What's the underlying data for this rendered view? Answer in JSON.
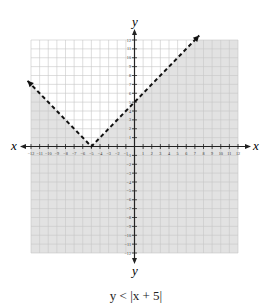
{
  "chart_data": {
    "type": "line",
    "title": "y < |x + 5|",
    "xlabel": "x",
    "ylabel": "y",
    "xlim": [
      -12,
      12
    ],
    "ylim": [
      -12,
      12
    ],
    "grid": true,
    "x_ticks": [
      -12,
      -11,
      -10,
      -9,
      -8,
      -7,
      -6,
      -5,
      -4,
      -3,
      -2,
      -1,
      1,
      2,
      3,
      4,
      5,
      6,
      7,
      8,
      9,
      10,
      11,
      12
    ],
    "y_ticks": [
      -12,
      -11,
      -10,
      -9,
      -8,
      -7,
      -6,
      -5,
      -4,
      -3,
      -2,
      -1,
      1,
      2,
      3,
      4,
      5,
      6,
      7,
      8,
      9,
      10,
      11,
      12
    ],
    "boundary": {
      "equation": "y = |x + 5|",
      "style": "dashed",
      "vertex": [
        -5,
        0
      ],
      "points": [
        [
          -12.4,
          7.4
        ],
        [
          -5,
          0
        ],
        [
          7.5,
          12.5
        ]
      ]
    },
    "shaded_region": "below boundary (y < |x + 5|)",
    "shade_color": "#e2e2e2"
  },
  "labels": {
    "x_axis": "x",
    "y_axis": "y",
    "caption": "y < |x + 5|"
  }
}
